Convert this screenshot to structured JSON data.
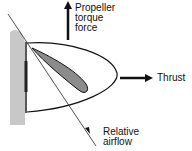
{
  "diagram": {
    "labels": {
      "torque_line1": "Propeller",
      "torque_line2": "torque",
      "torque_line3": "force",
      "thrust": "Thrust",
      "airflow_line1": "Relative",
      "airflow_line2": "airflow"
    },
    "colors": {
      "hub": "#c8c8c8",
      "airfoil": "#8c8c8c",
      "stroke": "#111111"
    }
  }
}
